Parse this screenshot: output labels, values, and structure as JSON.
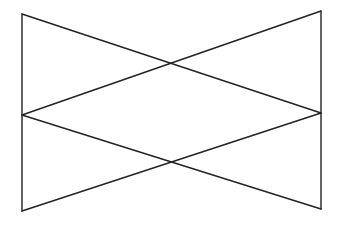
{
  "diagram": {
    "type": "line-figure",
    "width": 342,
    "height": 226,
    "background": "#ffffff",
    "stroke_color": "#222222",
    "stroke_width": 1.4,
    "vertices": {
      "top_left": [
        22,
        14
      ],
      "mid_left": [
        22,
        115
      ],
      "bottom_left": [
        22,
        211
      ],
      "top_right": [
        321,
        11
      ],
      "mid_right": [
        321,
        113
      ],
      "bottom_right": [
        321,
        209
      ]
    },
    "intersections": {
      "upper": [
        172,
        63
      ],
      "lower": [
        172,
        162
      ]
    },
    "segments": [
      {
        "id": "left-vertical",
        "from": "top_left",
        "to": "bottom_left"
      },
      {
        "id": "right-vertical",
        "from": "top_right",
        "to": "bottom_right"
      },
      {
        "id": "diag-topleft-to-midright",
        "from": "top_left",
        "to": "mid_right"
      },
      {
        "id": "diag-midleft-to-topright",
        "from": "mid_left",
        "to": "top_right"
      },
      {
        "id": "diag-midleft-to-bottomright",
        "from": "mid_left",
        "to": "bottom_right"
      },
      {
        "id": "diag-bottomleft-to-midright",
        "from": "bottom_left",
        "to": "mid_right"
      }
    ]
  }
}
